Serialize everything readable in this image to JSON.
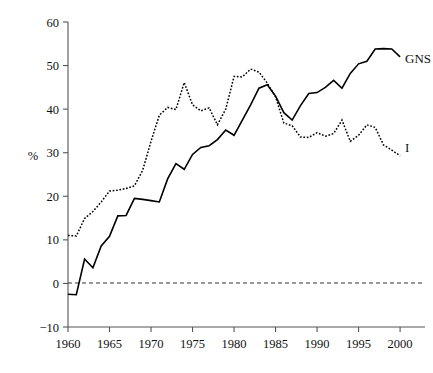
{
  "chart_data": {
    "type": "line",
    "title": "",
    "xlabel": "",
    "ylabel": "%",
    "xlim": [
      1960,
      2003
    ],
    "ylim": [
      -10,
      60
    ],
    "xticks": [
      1960,
      1965,
      1970,
      1975,
      1980,
      1985,
      1990,
      1995,
      2000
    ],
    "yticks": [
      -10,
      0,
      10,
      20,
      30,
      40,
      50,
      60
    ],
    "grid": false,
    "legend_position": "inline-right",
    "zero_reference_line": 0,
    "x": [
      1960,
      1961,
      1962,
      1963,
      1964,
      1965,
      1966,
      1967,
      1968,
      1969,
      1970,
      1971,
      1972,
      1973,
      1974,
      1975,
      1976,
      1977,
      1978,
      1979,
      1980,
      1981,
      1982,
      1983,
      1984,
      1985,
      1986,
      1987,
      1988,
      1989,
      1990,
      1991,
      1992,
      1993,
      1994,
      1995,
      1996,
      1997,
      1998,
      1999,
      2000
    ],
    "series": [
      {
        "name": "GNS",
        "label": "GNS",
        "style": "solid",
        "values": [
          -2.5,
          -2.6,
          5.6,
          3.6,
          8.6,
          10.8,
          15.5,
          15.6,
          19.5,
          19.3,
          19.0,
          18.7,
          24.0,
          27.5,
          26.2,
          29.6,
          31.2,
          31.6,
          33.0,
          35.2,
          34.0,
          37.5,
          41.0,
          44.8,
          45.6,
          43.0,
          39.2,
          37.5,
          40.8,
          43.6,
          43.8,
          45.0,
          46.6,
          44.8,
          48.2,
          50.4,
          51.0,
          53.8,
          53.9,
          53.8,
          52.0
        ]
      },
      {
        "name": "I",
        "label": "I",
        "style": "dotted",
        "values": [
          11.0,
          10.9,
          14.9,
          16.5,
          18.7,
          21.2,
          21.4,
          21.8,
          22.4,
          26.0,
          32.6,
          38.6,
          40.4,
          39.9,
          46.1,
          41.0,
          39.6,
          40.3,
          36.4,
          40.0,
          47.5,
          47.4,
          49.2,
          48.5,
          46.0,
          42.8,
          36.8,
          36.2,
          33.6,
          33.5,
          34.6,
          33.8,
          34.4,
          37.5,
          32.6,
          34.0,
          36.4,
          35.8,
          31.8,
          30.6,
          29.3
        ]
      }
    ],
    "annotations": [
      {
        "text": "GNS",
        "x": 2000.6,
        "y": 50.6
      },
      {
        "text": "I",
        "x": 2000.6,
        "y": 30.2
      }
    ]
  }
}
